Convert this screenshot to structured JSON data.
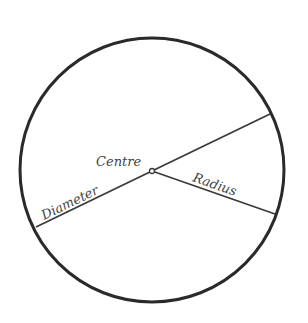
{
  "diagram": {
    "labels": {
      "centre": "Centre",
      "diameter": "Diameter",
      "radius": "Radius"
    },
    "colors": {
      "circle_stroke": "#2a2a2a",
      "line_stroke": "#3a3a3a",
      "text": "#444444",
      "background": "#ffffff"
    }
  }
}
